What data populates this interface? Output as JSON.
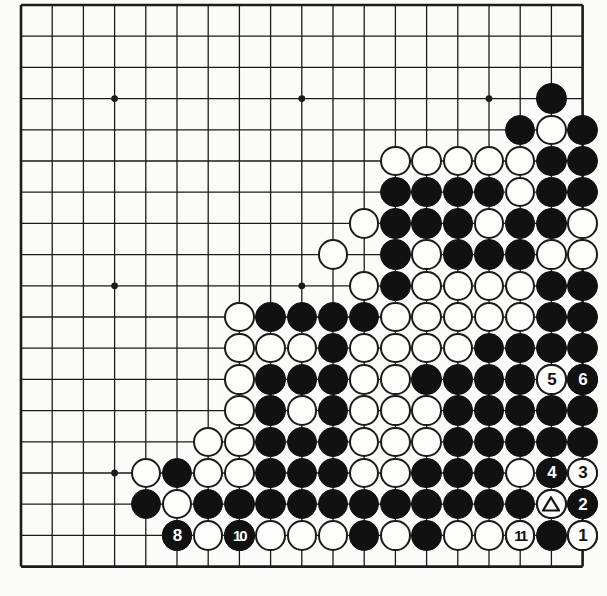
{
  "diagram": {
    "type": "go-board",
    "board_size": 19,
    "geometry": {
      "origin_x": 21,
      "origin_y": 5,
      "spacing": 31.2,
      "stone_radius": 15.2
    },
    "star_points": [
      [
        4,
        4
      ],
      [
        10,
        4
      ],
      [
        16,
        4
      ],
      [
        4,
        10
      ],
      [
        10,
        10
      ],
      [
        16,
        10
      ],
      [
        4,
        16
      ],
      [
        10,
        16
      ],
      [
        16,
        16
      ]
    ],
    "colors": {
      "board_background": "#fbfbf9",
      "line": "#1b1b1b",
      "black_stone": "#111111",
      "white_stone": "#fdfdfb",
      "white_stone_border": "#1b1b1b",
      "label_on_black": "#ffffff",
      "label_on_white": "#111111"
    },
    "black_stones": [
      [
        18,
        4
      ],
      [
        17,
        5
      ],
      [
        19,
        5
      ],
      [
        18,
        6
      ],
      [
        19,
        6
      ],
      [
        13,
        7
      ],
      [
        14,
        7
      ],
      [
        15,
        7
      ],
      [
        16,
        7
      ],
      [
        18,
        7
      ],
      [
        19,
        7
      ],
      [
        13,
        8
      ],
      [
        14,
        8
      ],
      [
        15,
        8
      ],
      [
        17,
        8
      ],
      [
        18,
        8
      ],
      [
        13,
        9
      ],
      [
        15,
        9
      ],
      [
        16,
        9
      ],
      [
        17,
        9
      ],
      [
        13,
        10
      ],
      [
        18,
        10
      ],
      [
        19,
        10
      ],
      [
        9,
        11
      ],
      [
        10,
        11
      ],
      [
        11,
        11
      ],
      [
        12,
        11
      ],
      [
        18,
        11
      ],
      [
        19,
        11
      ],
      [
        11,
        12
      ],
      [
        16,
        12
      ],
      [
        17,
        12
      ],
      [
        18,
        12
      ],
      [
        19,
        12
      ],
      [
        9,
        13
      ],
      [
        10,
        13
      ],
      [
        11,
        13
      ],
      [
        14,
        13
      ],
      [
        15,
        13
      ],
      [
        16,
        13
      ],
      [
        17,
        13
      ],
      [
        19,
        13
      ],
      [
        9,
        14
      ],
      [
        11,
        14
      ],
      [
        15,
        14
      ],
      [
        16,
        14
      ],
      [
        17,
        14
      ],
      [
        18,
        14
      ],
      [
        19,
        14
      ],
      [
        9,
        15
      ],
      [
        10,
        15
      ],
      [
        11,
        15
      ],
      [
        15,
        15
      ],
      [
        16,
        15
      ],
      [
        17,
        15
      ],
      [
        18,
        15
      ],
      [
        19,
        15
      ],
      [
        6,
        16
      ],
      [
        9,
        16
      ],
      [
        10,
        16
      ],
      [
        11,
        16
      ],
      [
        14,
        16
      ],
      [
        15,
        16
      ],
      [
        16,
        16
      ],
      [
        19,
        16
      ],
      [
        5,
        17
      ],
      [
        7,
        17
      ],
      [
        8,
        17
      ],
      [
        9,
        17
      ],
      [
        10,
        17
      ],
      [
        11,
        17
      ],
      [
        12,
        17
      ],
      [
        13,
        17
      ],
      [
        14,
        17
      ],
      [
        15,
        17
      ],
      [
        16,
        17
      ],
      [
        17,
        17
      ],
      [
        19,
        17
      ],
      [
        6,
        18
      ],
      [
        8,
        18
      ],
      [
        12,
        18
      ],
      [
        14,
        18
      ],
      [
        18,
        18
      ]
    ],
    "white_stones": [
      [
        18,
        5
      ],
      [
        17,
        6
      ],
      [
        13,
        6
      ],
      [
        14,
        6
      ],
      [
        15,
        6
      ],
      [
        16,
        6
      ],
      [
        17,
        7
      ],
      [
        12,
        8
      ],
      [
        16,
        8
      ],
      [
        19,
        8
      ],
      [
        11,
        9
      ],
      [
        14,
        9
      ],
      [
        18,
        9
      ],
      [
        19,
        9
      ],
      [
        12,
        10
      ],
      [
        14,
        10
      ],
      [
        15,
        10
      ],
      [
        16,
        10
      ],
      [
        17,
        10
      ],
      [
        8,
        11
      ],
      [
        13,
        11
      ],
      [
        14,
        11
      ],
      [
        15,
        11
      ],
      [
        16,
        11
      ],
      [
        17,
        11
      ],
      [
        8,
        12
      ],
      [
        9,
        12
      ],
      [
        10,
        12
      ],
      [
        12,
        12
      ],
      [
        13,
        12
      ],
      [
        14,
        12
      ],
      [
        15,
        12
      ],
      [
        8,
        13
      ],
      [
        12,
        13
      ],
      [
        13,
        13
      ],
      [
        18,
        13
      ],
      [
        8,
        14
      ],
      [
        10,
        14
      ],
      [
        12,
        14
      ],
      [
        13,
        14
      ],
      [
        14,
        14
      ],
      [
        7,
        15
      ],
      [
        8,
        15
      ],
      [
        12,
        15
      ],
      [
        13,
        15
      ],
      [
        14,
        15
      ],
      [
        5,
        16
      ],
      [
        7,
        16
      ],
      [
        8,
        16
      ],
      [
        12,
        16
      ],
      [
        13,
        16
      ],
      [
        17,
        16
      ],
      [
        18,
        16
      ],
      [
        6,
        17
      ],
      [
        18,
        17
      ],
      [
        7,
        18
      ],
      [
        9,
        18
      ],
      [
        10,
        18
      ],
      [
        11,
        18
      ],
      [
        13,
        18
      ],
      [
        15,
        18
      ],
      [
        16,
        18
      ],
      [
        17,
        18
      ],
      [
        19,
        18
      ]
    ],
    "numbered_moves": [
      {
        "label": "1",
        "col": 19,
        "row": 18,
        "color": "white"
      },
      {
        "label": "2",
        "col": 19,
        "row": 17,
        "color": "black"
      },
      {
        "label": "3",
        "col": 19,
        "row": 16,
        "color": "white"
      },
      {
        "label": "4",
        "col": 18,
        "row": 16,
        "color": "black"
      },
      {
        "label": "5",
        "col": 18,
        "row": 13,
        "color": "white"
      },
      {
        "label": "6",
        "col": 19,
        "row": 13,
        "color": "black"
      },
      {
        "label": "8",
        "col": 6,
        "row": 18,
        "color": "black"
      },
      {
        "label": "10",
        "col": 8,
        "row": 18,
        "color": "black"
      },
      {
        "label": "11",
        "col": 17,
        "row": 18,
        "color": "white"
      }
    ],
    "marked_stones": [
      {
        "mark": "triangle",
        "col": 18,
        "row": 17,
        "color": "white"
      }
    ]
  }
}
